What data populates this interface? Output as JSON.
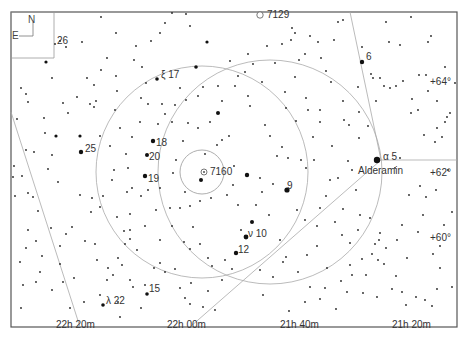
{
  "chart": {
    "frame": {
      "x": 11,
      "y": 12,
      "w": 446,
      "h": 315
    },
    "orientation": {
      "north": "N",
      "east": "E"
    },
    "ra_labels": [
      {
        "text": "22h 20m",
        "x": 56,
        "y": 320
      },
      {
        "text": "22h 00m",
        "x": 167,
        "y": 320
      },
      {
        "text": "21h 40m",
        "x": 280,
        "y": 320
      },
      {
        "text": "21h 20m",
        "x": 392,
        "y": 320
      }
    ],
    "dec_labels": [
      {
        "text": "+64°",
        "x": 430,
        "y": 77
      },
      {
        "text": "+62°",
        "x": 430,
        "y": 168
      },
      {
        "text": "+60°",
        "x": 430,
        "y": 233
      }
    ],
    "objects": [
      {
        "text": "7129",
        "x": 267,
        "y": 11,
        "symbol": "open-cluster"
      },
      {
        "text": "7160",
        "x": 210,
        "y": 167,
        "symbol": "open-cluster"
      }
    ],
    "star_labels": [
      {
        "text": "26",
        "x": 57,
        "y": 38
      },
      {
        "text": "6",
        "x": 366,
        "y": 54
      },
      {
        "text": "ξ 17",
        "x": 161,
        "y": 71
      },
      {
        "text": "25",
        "x": 85,
        "y": 145
      },
      {
        "text": "18",
        "x": 156,
        "y": 139
      },
      {
        "text": "20",
        "x": 149,
        "y": 153
      },
      {
        "text": "19",
        "x": 148,
        "y": 175
      },
      {
        "text": "9",
        "x": 287,
        "y": 183
      },
      {
        "text": "α 5",
        "x": 383,
        "y": 154
      },
      {
        "text": "Alderamin",
        "x": 358,
        "y": 168
      },
      {
        "text": "ν 10",
        "x": 248,
        "y": 230
      },
      {
        "text": "12",
        "x": 238,
        "y": 246
      },
      {
        "text": "15",
        "x": 149,
        "y": 286
      },
      {
        "text": "λ 22",
        "x": 106,
        "y": 298
      }
    ],
    "bright_stars": [
      [
        377,
        160,
        3.2
      ],
      [
        287,
        190,
        2.6
      ],
      [
        246,
        237,
        2.4
      ],
      [
        236,
        253,
        2.2
      ],
      [
        201,
        180,
        2.0
      ],
      [
        247,
        175,
        2.2
      ],
      [
        252,
        222,
        2.0
      ],
      [
        218,
        113,
        2.0
      ],
      [
        362,
        62,
        2.2
      ],
      [
        153,
        141,
        2.2
      ],
      [
        147,
        155,
        2.0
      ],
      [
        145,
        176,
        2.2
      ],
      [
        81,
        152,
        2.2
      ],
      [
        157,
        79,
        1.8
      ],
      [
        103,
        305,
        1.8
      ],
      [
        147,
        294,
        1.8
      ],
      [
        196,
        67,
        1.8
      ],
      [
        207,
        42,
        1.6
      ],
      [
        80,
        136,
        1.6
      ],
      [
        46,
        62,
        1.6
      ],
      [
        56,
        136,
        1.6
      ]
    ],
    "faint_stars": [
      [
        55,
        44
      ],
      [
        60,
        41
      ],
      [
        66,
        47
      ],
      [
        82,
        42
      ],
      [
        101,
        17
      ],
      [
        77,
        97
      ],
      [
        90,
        104
      ],
      [
        96,
        101
      ],
      [
        94,
        107
      ],
      [
        52,
        78
      ],
      [
        17,
        119
      ],
      [
        26,
        150
      ],
      [
        52,
        155
      ],
      [
        48,
        169
      ],
      [
        58,
        182
      ],
      [
        38,
        211
      ],
      [
        28,
        193
      ],
      [
        33,
        197
      ],
      [
        51,
        228
      ],
      [
        66,
        234
      ],
      [
        72,
        227
      ],
      [
        85,
        241
      ],
      [
        95,
        244
      ],
      [
        92,
        198
      ],
      [
        15,
        196
      ],
      [
        13,
        177
      ],
      [
        14,
        166
      ],
      [
        22,
        176
      ],
      [
        36,
        241
      ],
      [
        60,
        246
      ],
      [
        80,
        195
      ],
      [
        115,
        110
      ],
      [
        120,
        128
      ],
      [
        128,
        168
      ],
      [
        127,
        192
      ],
      [
        130,
        214
      ],
      [
        132,
        188
      ],
      [
        141,
        196
      ],
      [
        124,
        231
      ],
      [
        130,
        239
      ],
      [
        137,
        250
      ],
      [
        148,
        190
      ],
      [
        156,
        210
      ],
      [
        160,
        188
      ],
      [
        170,
        208
      ],
      [
        173,
        173
      ],
      [
        180,
        208
      ],
      [
        185,
        192
      ],
      [
        190,
        206
      ],
      [
        193,
        227
      ],
      [
        200,
        201
      ],
      [
        211,
        198
      ],
      [
        176,
        160
      ],
      [
        183,
        141
      ],
      [
        205,
        154
      ],
      [
        210,
        122
      ],
      [
        217,
        145
      ],
      [
        222,
        140
      ],
      [
        229,
        136
      ],
      [
        234,
        166
      ],
      [
        227,
        195
      ],
      [
        233,
        185
      ],
      [
        238,
        205
      ],
      [
        241,
        230
      ],
      [
        256,
        205
      ],
      [
        260,
        178
      ],
      [
        262,
        192
      ],
      [
        269,
        215
      ],
      [
        273,
        184
      ],
      [
        280,
        240
      ],
      [
        286,
        257
      ],
      [
        260,
        270
      ],
      [
        273,
        277
      ],
      [
        283,
        262
      ],
      [
        263,
        295
      ],
      [
        289,
        311
      ],
      [
        305,
        302
      ],
      [
        310,
        287
      ],
      [
        320,
        299
      ],
      [
        325,
        288
      ],
      [
        347,
        292
      ],
      [
        363,
        293
      ],
      [
        352,
        275
      ],
      [
        366,
        275
      ],
      [
        372,
        254
      ],
      [
        375,
        244
      ],
      [
        378,
        260
      ],
      [
        380,
        233
      ],
      [
        384,
        264
      ],
      [
        396,
        276
      ],
      [
        392,
        289
      ],
      [
        402,
        292
      ],
      [
        370,
        218
      ],
      [
        350,
        243
      ],
      [
        327,
        268
      ],
      [
        377,
        297
      ],
      [
        379,
        240
      ],
      [
        386,
        248
      ],
      [
        406,
        305
      ],
      [
        425,
        300
      ],
      [
        437,
        289
      ],
      [
        432,
        306
      ],
      [
        416,
        297
      ],
      [
        418,
        232
      ],
      [
        433,
        254
      ],
      [
        440,
        246
      ],
      [
        440,
        268
      ],
      [
        452,
        287
      ],
      [
        435,
        142
      ],
      [
        437,
        128
      ],
      [
        442,
        137
      ],
      [
        450,
        113
      ],
      [
        447,
        117
      ],
      [
        445,
        122
      ],
      [
        424,
        135
      ],
      [
        418,
        110
      ],
      [
        412,
        99
      ],
      [
        428,
        91
      ],
      [
        437,
        101
      ],
      [
        455,
        83
      ],
      [
        445,
        67
      ],
      [
        431,
        36
      ],
      [
        400,
        45
      ],
      [
        389,
        42
      ],
      [
        373,
        78
      ],
      [
        371,
        74
      ],
      [
        376,
        101
      ],
      [
        380,
        78
      ],
      [
        384,
        86
      ],
      [
        390,
        88
      ],
      [
        396,
        86
      ],
      [
        403,
        81
      ],
      [
        419,
        75
      ],
      [
        411,
        113
      ],
      [
        426,
        75
      ],
      [
        362,
        47
      ],
      [
        343,
        20
      ],
      [
        386,
        22
      ],
      [
        411,
        17
      ],
      [
        428,
        42
      ],
      [
        318,
        42
      ],
      [
        292,
        28
      ],
      [
        295,
        33
      ],
      [
        310,
        36
      ],
      [
        334,
        40
      ],
      [
        338,
        22
      ],
      [
        321,
        58
      ],
      [
        326,
        71
      ],
      [
        331,
        82
      ],
      [
        358,
        87
      ],
      [
        343,
        101
      ],
      [
        344,
        120
      ],
      [
        349,
        125
      ],
      [
        359,
        138
      ],
      [
        352,
        170
      ],
      [
        348,
        161
      ],
      [
        356,
        190
      ],
      [
        320,
        110
      ],
      [
        320,
        122
      ],
      [
        313,
        137
      ],
      [
        296,
        121
      ],
      [
        306,
        98
      ],
      [
        295,
        77
      ],
      [
        285,
        92
      ],
      [
        286,
        108
      ],
      [
        262,
        82
      ],
      [
        248,
        96
      ],
      [
        250,
        106
      ],
      [
        235,
        86
      ],
      [
        248,
        54
      ],
      [
        253,
        64
      ],
      [
        245,
        72
      ],
      [
        265,
        125
      ],
      [
        270,
        136
      ],
      [
        282,
        147
      ],
      [
        277,
        156
      ],
      [
        288,
        158
      ],
      [
        301,
        160
      ],
      [
        306,
        168
      ],
      [
        314,
        160
      ],
      [
        320,
        208
      ],
      [
        317,
        226
      ],
      [
        305,
        220
      ],
      [
        297,
        210
      ],
      [
        330,
        180
      ],
      [
        338,
        178
      ],
      [
        332,
        146
      ],
      [
        326,
        196
      ],
      [
        335,
        222
      ],
      [
        342,
        235
      ],
      [
        317,
        246
      ],
      [
        307,
        255
      ],
      [
        298,
        272
      ],
      [
        225,
        260
      ],
      [
        212,
        266
      ],
      [
        191,
        283
      ],
      [
        180,
        288
      ],
      [
        185,
        298
      ],
      [
        190,
        304
      ],
      [
        203,
        307
      ],
      [
        208,
        291
      ],
      [
        215,
        310
      ],
      [
        222,
        280
      ],
      [
        232,
        269
      ],
      [
        175,
        269
      ],
      [
        165,
        272
      ],
      [
        160,
        263
      ],
      [
        154,
        268
      ],
      [
        145,
        285
      ],
      [
        133,
        287
      ],
      [
        130,
        280
      ],
      [
        141,
        308
      ],
      [
        118,
        302
      ],
      [
        120,
        317
      ],
      [
        100,
        295
      ],
      [
        107,
        280
      ],
      [
        113,
        275
      ],
      [
        118,
        258
      ],
      [
        122,
        265
      ],
      [
        108,
        268
      ],
      [
        97,
        260
      ],
      [
        74,
        278
      ],
      [
        60,
        264
      ],
      [
        63,
        282
      ],
      [
        52,
        290
      ],
      [
        40,
        272
      ],
      [
        36,
        282
      ],
      [
        21,
        308
      ],
      [
        70,
        308
      ],
      [
        84,
        302
      ],
      [
        42,
        256
      ],
      [
        28,
        230
      ],
      [
        26,
        248
      ],
      [
        20,
        262
      ],
      [
        23,
        285
      ],
      [
        130,
        230
      ],
      [
        145,
        226
      ],
      [
        160,
        240
      ],
      [
        172,
        226
      ],
      [
        184,
        242
      ],
      [
        190,
        249
      ],
      [
        200,
        244
      ],
      [
        208,
        258
      ],
      [
        172,
        122
      ],
      [
        165,
        114
      ],
      [
        162,
        104
      ],
      [
        136,
        46
      ],
      [
        116,
        33
      ],
      [
        160,
        33
      ],
      [
        165,
        23
      ],
      [
        172,
        13
      ],
      [
        186,
        14
      ],
      [
        190,
        26
      ],
      [
        151,
        41
      ],
      [
        142,
        67
      ],
      [
        134,
        60
      ],
      [
        175,
        105
      ],
      [
        186,
        100
      ],
      [
        198,
        96
      ],
      [
        198,
        128
      ],
      [
        188,
        123
      ],
      [
        203,
        87
      ],
      [
        218,
        86
      ],
      [
        222,
        101
      ],
      [
        230,
        61
      ],
      [
        238,
        76
      ],
      [
        180,
        88
      ],
      [
        158,
        124
      ],
      [
        140,
        122
      ],
      [
        132,
        137
      ],
      [
        126,
        154
      ],
      [
        114,
        170
      ],
      [
        112,
        180
      ],
      [
        103,
        196
      ],
      [
        100,
        207
      ],
      [
        91,
        212
      ],
      [
        117,
        217
      ],
      [
        125,
        244
      ],
      [
        110,
        146
      ],
      [
        100,
        136
      ],
      [
        63,
        103
      ],
      [
        68,
        113
      ],
      [
        44,
        118
      ],
      [
        45,
        133
      ],
      [
        34,
        152
      ],
      [
        28,
        102
      ],
      [
        21,
        88
      ],
      [
        26,
        94
      ],
      [
        87,
        78
      ],
      [
        94,
        85
      ],
      [
        101,
        70
      ],
      [
        116,
        76
      ],
      [
        117,
        91
      ],
      [
        107,
        58
      ],
      [
        141,
        98
      ],
      [
        148,
        104
      ],
      [
        146,
        83
      ],
      [
        267,
        46
      ],
      [
        282,
        44
      ],
      [
        291,
        40
      ],
      [
        275,
        63
      ],
      [
        299,
        60
      ],
      [
        305,
        54
      ],
      [
        308,
        110
      ],
      [
        359,
        112
      ],
      [
        368,
        126
      ],
      [
        400,
        158
      ],
      [
        395,
        168
      ],
      [
        420,
        186
      ],
      [
        409,
        195
      ],
      [
        426,
        197
      ],
      [
        436,
        190
      ],
      [
        448,
        170
      ],
      [
        402,
        225
      ],
      [
        397,
        240
      ],
      [
        407,
        258
      ],
      [
        423,
        215
      ],
      [
        444,
        225
      ],
      [
        452,
        212
      ],
      [
        343,
        209
      ],
      [
        360,
        215
      ],
      [
        358,
        230
      ],
      [
        362,
        259
      ],
      [
        350,
        265
      ],
      [
        341,
        281
      ],
      [
        336,
        309
      ]
    ]
  }
}
